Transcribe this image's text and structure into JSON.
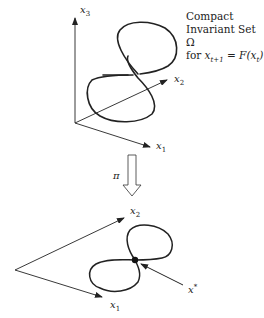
{
  "top_figure": {
    "axes": {
      "x1": {
        "label": "x",
        "sub": "1"
      },
      "x2": {
        "label": "x",
        "sub": "2"
      },
      "x3": {
        "label": "x",
        "sub": "3"
      }
    },
    "caption": {
      "line1": "Compact",
      "line2": "Invariant Set Ω",
      "line3_prefix": "for ",
      "line3_math": "x_{t+1} = F(x_t)"
    },
    "curve": "figure-eight closed curve (3D)"
  },
  "projection": {
    "label": "π",
    "arrow": "hollow down arrow"
  },
  "bottom_figure": {
    "axes": {
      "x1": {
        "label": "x",
        "sub": "1"
      },
      "x2": {
        "label": "x",
        "sub": "2"
      }
    },
    "point": {
      "label": "x",
      "sup": "*"
    },
    "curve": "figure-eight projection with self-intersection"
  },
  "colors": {
    "stroke": "#222222",
    "background": "#ffffff"
  }
}
